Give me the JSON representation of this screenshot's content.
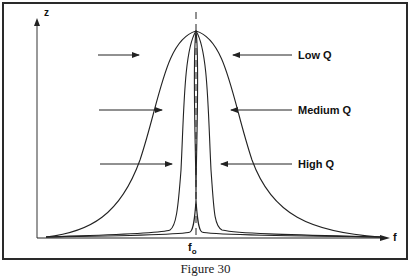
{
  "figure": {
    "caption": "Figure 30",
    "axes": {
      "y_label": "z",
      "x_label": "f",
      "center_label": "f",
      "center_subscript": "o"
    },
    "annotations": [
      {
        "label": "Low Q",
        "curve": "widest"
      },
      {
        "label": "Medium Q",
        "curve": "middle"
      },
      {
        "label": "High Q",
        "curve": "narrowest"
      }
    ],
    "colors": {
      "line": "#222222",
      "frame": "#2a2a2a",
      "background": "#ffffff"
    }
  }
}
